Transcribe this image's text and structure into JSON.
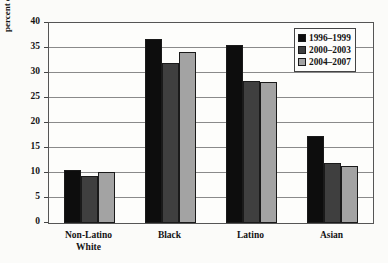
{
  "chart_data": {
    "type": "bar",
    "title": "",
    "xlabel": "",
    "ylabel": "percent of children (<18 yrs old) in poverty",
    "ylim": [
      0,
      40
    ],
    "ytick_step": 5,
    "yticks": [
      40,
      35,
      30,
      25,
      20,
      15,
      10,
      5,
      0
    ],
    "grid": true,
    "legend_position": "top-right",
    "categories": [
      "Non-Latino\nWhite",
      "Black",
      "Latino",
      "Asian"
    ],
    "series": [
      {
        "name": "1996–1999",
        "color": "#0d0d0d",
        "values": [
          10.7,
          36.8,
          35.6,
          17.5
        ]
      },
      {
        "name": "2000–2003",
        "color": "#3f3f3f",
        "values": [
          9.4,
          32.0,
          28.5,
          12.1
        ]
      },
      {
        "name": "2004–2007",
        "color": "#a3a3a3",
        "values": [
          10.2,
          34.2,
          28.3,
          11.4
        ]
      }
    ]
  }
}
